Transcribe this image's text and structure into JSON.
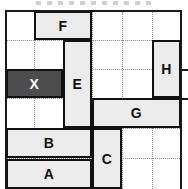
{
  "figure": {
    "name": "sliding-block-puzzle-diagram",
    "frame": {
      "x": 5,
      "y": 10,
      "width": 177,
      "height": 181,
      "border_color": "#1a1a1a",
      "background": "#ffffff"
    },
    "grid": {
      "cell_size": 29.5,
      "line_style": "dotted",
      "line_color": "#8a8a8a",
      "vertical_x": [
        34,
        63,
        92,
        122,
        152
      ],
      "horizontal_y": [
        40,
        69,
        98,
        128,
        158
      ]
    },
    "colors": {
      "block_fill": "#ececec",
      "block_border": "#111111",
      "target_fill": "#4d4d4d",
      "target_text": "#ffffff",
      "grid_line": "#8a8a8a",
      "frame_border": "#1a1a1a"
    },
    "blocks": [
      {
        "label": "F",
        "x": 34,
        "y": 11,
        "width": 58,
        "height": 29,
        "target": false
      },
      {
        "label": "E",
        "x": 63,
        "y": 40,
        "width": 29,
        "height": 88,
        "target": false
      },
      {
        "label": "H",
        "x": 152,
        "y": 40,
        "width": 29,
        "height": 58,
        "target": false
      },
      {
        "label": "X",
        "x": 6,
        "y": 69,
        "width": 57,
        "height": 29,
        "target": true
      },
      {
        "label": "G",
        "x": 92,
        "y": 98,
        "width": 89,
        "height": 30,
        "target": false
      },
      {
        "label": "B",
        "x": 6,
        "y": 128,
        "width": 86,
        "height": 30,
        "target": false
      },
      {
        "label": "C",
        "x": 92,
        "y": 128,
        "width": 30,
        "height": 61,
        "target": false
      },
      {
        "label": "A",
        "x": 6,
        "y": 159,
        "width": 86,
        "height": 30,
        "target": false
      }
    ],
    "exit_ticks": [
      {
        "name": "exit-tick-upper",
        "x": 182,
        "y": 69,
        "width": 6
      },
      {
        "name": "exit-tick-lower",
        "x": 182,
        "y": 98,
        "width": 6
      }
    ]
  }
}
